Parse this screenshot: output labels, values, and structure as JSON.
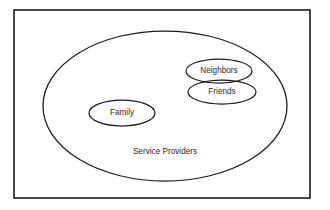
{
  "diagram": {
    "type": "venn-nested-ellipse",
    "title_text_visible": false,
    "background_color": "#ffffff",
    "stroke_color": "#1b1b1b",
    "text_color": "#2a2a2a",
    "frame": {
      "name": "outer-border",
      "x": 14,
      "y": 10,
      "width": 296,
      "height": 188
    },
    "sets": [
      {
        "id": "service-providers",
        "label": "Service Providers",
        "shape": "ellipse",
        "cx": 165,
        "cy": 106,
        "rx": 122,
        "ry": 75,
        "label_x": 165,
        "label_y": 152,
        "level": "outer"
      },
      {
        "id": "family",
        "label": "Family",
        "shape": "ellipse",
        "cx": 122,
        "cy": 113,
        "rx": 33,
        "ry": 13,
        "label_x": 122,
        "label_y": 113,
        "level": "inner"
      },
      {
        "id": "neighbors",
        "label": "Neighbors",
        "shape": "ellipse",
        "cx": 219,
        "cy": 71,
        "rx": 33,
        "ry": 12,
        "label_x": 219,
        "label_y": 71,
        "level": "inner"
      },
      {
        "id": "friends",
        "label": "Friends",
        "shape": "ellipse",
        "cx": 222,
        "cy": 92,
        "rx": 34,
        "ry": 12,
        "label_x": 222,
        "label_y": 92,
        "level": "inner"
      }
    ],
    "relationships": [
      {
        "from": "neighbors",
        "to": "friends",
        "kind": "overlap"
      },
      {
        "from": "service-providers",
        "to": "family",
        "kind": "contains"
      },
      {
        "from": "service-providers",
        "to": "neighbors",
        "kind": "contains"
      },
      {
        "from": "service-providers",
        "to": "friends",
        "kind": "contains"
      }
    ]
  }
}
